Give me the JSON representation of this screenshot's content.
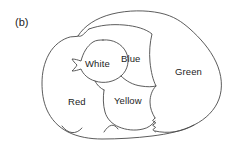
{
  "figure": {
    "panel_label": "(b)",
    "caption_position": "top-left",
    "background_color": "#ffffff",
    "ink_color": "#4a4a4a",
    "text_color": "#1d1d1d",
    "style": "hand-drawn line map"
  },
  "map": {
    "outer_boundary_name": "map-outer-boundary",
    "region_count": 5,
    "regions": [
      {
        "id": "red",
        "label": "Red",
        "label_x": 68,
        "label_y": 97,
        "fill": "#ffffff",
        "stroke": "#4a4a4a"
      },
      {
        "id": "white",
        "label": "White",
        "label_x": 85,
        "label_y": 59,
        "fill": "#ffffff",
        "stroke": "#4a4a4a"
      },
      {
        "id": "blue",
        "label": "Blue",
        "label_x": 121,
        "label_y": 54,
        "fill": "#ffffff",
        "stroke": "#4a4a4a"
      },
      {
        "id": "yellow",
        "label": "Yellow",
        "label_x": 114,
        "label_y": 96,
        "fill": "#ffffff",
        "stroke": "#4a4a4a"
      },
      {
        "id": "green",
        "label": "Green",
        "label_x": 175,
        "label_y": 67,
        "fill": "#ffffff",
        "stroke": "#4a4a4a"
      }
    ]
  }
}
